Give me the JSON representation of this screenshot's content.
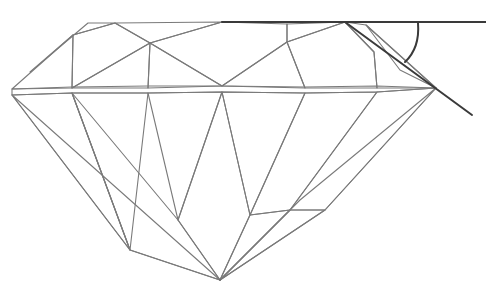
{
  "figure": {
    "parts": [
      "table",
      "crown",
      "girdle",
      "pavilion",
      "culet"
    ],
    "annotation": "crown-angle arc between table reference line and crown slope"
  },
  "colors": {
    "background": "#ffffff",
    "facet_edge": "#7a7a7a",
    "reference_line": "#3a3a3a",
    "shade_dark": "#9a9a9a",
    "shade_light": "#ffffff"
  }
}
